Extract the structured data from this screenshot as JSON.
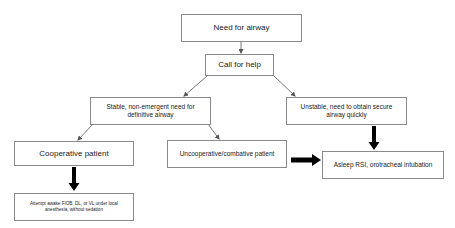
{
  "diagram": {
    "nodes": {
      "need_for_airway": {
        "label": "Need for airway"
      },
      "call_for_help": {
        "label": "Call for help"
      },
      "stable": {
        "label": "Stable, non-emergent need for definitive airway"
      },
      "unstable": {
        "label": "Unstable, need to obtain secure airway quickly"
      },
      "cooperative": {
        "label": "Cooperative patient"
      },
      "uncooperative": {
        "label": "Uncooperative/combative patient"
      },
      "asleep_rsi": {
        "label": "Asleep RSI, orotracheal intubation"
      },
      "attempt_awake": {
        "label": "Attempt awake FIOB, DL, or VL under local anesthesia, without sedation"
      }
    },
    "edges": [
      {
        "from": "need_for_airway",
        "to": "call_for_help",
        "style": "thin"
      },
      {
        "from": "call_for_help",
        "to": "stable",
        "style": "thin"
      },
      {
        "from": "call_for_help",
        "to": "unstable",
        "style": "thin"
      },
      {
        "from": "stable",
        "to": "cooperative",
        "style": "thin"
      },
      {
        "from": "stable",
        "to": "uncooperative",
        "style": "thin"
      },
      {
        "from": "unstable",
        "to": "asleep_rsi",
        "style": "thick"
      },
      {
        "from": "uncooperative",
        "to": "asleep_rsi",
        "style": "thick"
      },
      {
        "from": "cooperative",
        "to": "attempt_awake",
        "style": "thick"
      }
    ],
    "colors": {
      "border": "#8a8a8a",
      "text": "#222222",
      "thin_arrow": "#555555",
      "thick_arrow": "#000000"
    }
  }
}
